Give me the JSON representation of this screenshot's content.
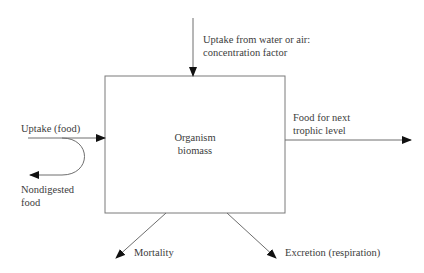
{
  "diagram": {
    "box": {
      "label_line1": "Organism",
      "label_line2": "biomass"
    },
    "flows": {
      "top_input": {
        "line1": "Uptake from water or air:",
        "line2": "concentration factor"
      },
      "left_input": {
        "label": "Uptake (food)"
      },
      "left_output": {
        "line1": "Nondigested",
        "line2": "food"
      },
      "right_output": {
        "line1": "Food for next",
        "line2": "trophic level"
      },
      "bottom_left_output": {
        "label": "Mortality"
      },
      "bottom_right_output": {
        "label": "Excretion (respiration)"
      }
    },
    "colors": {
      "line": "#6e6e6e",
      "arrowhead": "#111111",
      "text": "#3c3c3c",
      "background": "#ffffff"
    }
  }
}
